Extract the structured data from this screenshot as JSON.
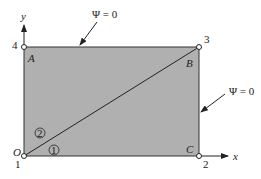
{
  "diagram": {
    "colors": {
      "region_fill": "#b0b0b0",
      "line": "#333333",
      "background": "#ffffff"
    },
    "axes": {
      "x_label": "x",
      "y_label": "y"
    },
    "nodes": [
      {
        "id": "1",
        "label": "1",
        "x": 24,
        "y": 156
      },
      {
        "id": "2",
        "label": "2",
        "x": 199,
        "y": 156
      },
      {
        "id": "3",
        "label": "3",
        "x": 199,
        "y": 47
      },
      {
        "id": "4",
        "label": "4",
        "x": 24,
        "y": 47
      }
    ],
    "corner_letters": {
      "origin": "O",
      "A": "A",
      "B": "B",
      "C": "C"
    },
    "elements": [
      {
        "id": "1",
        "label": "①",
        "circled": "1"
      },
      {
        "id": "2",
        "label": "②",
        "circled": "2"
      }
    ],
    "boundary_conditions": [
      {
        "text": "Ψ = 0",
        "target": "top-edge"
      },
      {
        "text": "Ψ = 0",
        "target": "right-edge"
      }
    ]
  }
}
